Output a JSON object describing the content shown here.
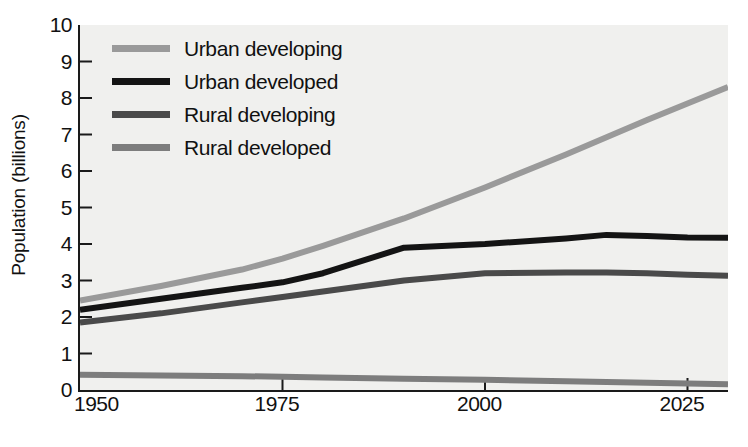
{
  "chart_data": {
    "type": "line",
    "title": "",
    "xlabel": "",
    "ylabel": "Population (billions)",
    "xlim": [
      1950,
      2030
    ],
    "ylim": [
      0,
      10
    ],
    "xticks": [
      1950,
      1975,
      2000,
      2025
    ],
    "yticks": [
      0,
      1,
      2,
      3,
      4,
      5,
      6,
      7,
      8,
      9,
      10
    ],
    "xtick_labels": [
      "1950",
      "1975",
      "2000",
      "2025"
    ],
    "ytick_labels": [
      "0",
      "1",
      "2",
      "3",
      "4",
      "5",
      "6",
      "7",
      "8",
      "9",
      "10"
    ],
    "grid": false,
    "legend_position": "upper left",
    "plot_background": "#f0f0ee",
    "series": [
      {
        "name": "Urban developing",
        "color": "#9a9a9a",
        "x": [
          1950,
          1960,
          1970,
          1975,
          1980,
          1990,
          2000,
          2010,
          2020,
          2025,
          2030
        ],
        "values": [
          2.45,
          2.85,
          3.3,
          3.6,
          3.95,
          4.7,
          5.55,
          6.45,
          7.4,
          7.85,
          8.3
        ]
      },
      {
        "name": "Urban developed",
        "color": "#141414",
        "x": [
          1950,
          1960,
          1970,
          1975,
          1980,
          1990,
          2000,
          2010,
          2015,
          2020,
          2025,
          2030
        ],
        "values": [
          2.2,
          2.5,
          2.8,
          2.95,
          3.2,
          3.9,
          4.0,
          4.15,
          4.25,
          4.22,
          4.18,
          4.17
        ]
      },
      {
        "name": "Rural developing",
        "color": "#4a4a4a",
        "x": [
          1950,
          1960,
          1970,
          1975,
          1980,
          1990,
          2000,
          2010,
          2015,
          2020,
          2025,
          2030
        ],
        "values": [
          1.85,
          2.1,
          2.4,
          2.55,
          2.7,
          3.0,
          3.2,
          3.22,
          3.22,
          3.2,
          3.16,
          3.13
        ]
      },
      {
        "name": "Rural developed",
        "color": "#7d7d7d",
        "x": [
          1950,
          1960,
          1970,
          1975,
          1980,
          1990,
          2000,
          2010,
          2020,
          2025,
          2030
        ],
        "values": [
          0.42,
          0.4,
          0.38,
          0.36,
          0.34,
          0.31,
          0.28,
          0.24,
          0.2,
          0.18,
          0.16
        ]
      }
    ]
  },
  "legend": {
    "items": [
      {
        "label": "Urban developing",
        "color": "#9a9a9a"
      },
      {
        "label": "Urban developed",
        "color": "#141414"
      },
      {
        "label": "Rural developing",
        "color": "#4a4a4a"
      },
      {
        "label": "Rural developed",
        "color": "#7d7d7d"
      }
    ]
  },
  "axis": {
    "y_title": "Population (billions)"
  }
}
